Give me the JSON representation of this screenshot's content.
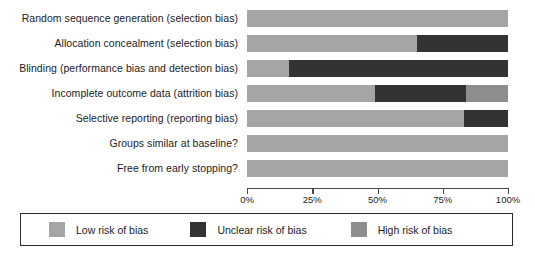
{
  "chart_data": {
    "type": "bar",
    "orientation": "horizontal",
    "stacked": true,
    "title": "",
    "xlabel": "",
    "ylabel": "",
    "xlim": [
      0,
      100
    ],
    "grid": false,
    "legend_position": "bottom",
    "categories": [
      "Random sequence generation (selection bias)",
      "Allocation concealment (selection bias)",
      "Blinding (performance bias and detection bias)",
      "Incomplete outcome data (attrition bias)",
      "Selective reporting (reporting bias)",
      "Groups similar at baseline?",
      "Free from early stopping?"
    ],
    "series": [
      {
        "name": "Low risk of bias",
        "color": "#a5a5a5",
        "values": [
          100,
          65,
          16,
          49,
          83,
          100,
          100
        ]
      },
      {
        "name": "Unclear risk of bias",
        "color": "#333333",
        "values": [
          0,
          35,
          84,
          35,
          17,
          0,
          0
        ]
      },
      {
        "name": "High risk of bias",
        "color": "#8e8e8e",
        "values": [
          0,
          0,
          0,
          16,
          0,
          0,
          0
        ]
      }
    ],
    "tick_values": [
      0,
      25,
      50,
      75,
      100
    ],
    "tick_labels": [
      "0%",
      "25%",
      "50%",
      "75%",
      "100%"
    ]
  },
  "axis": {
    "ticks": [
      {
        "label": "0%",
        "value": 0
      },
      {
        "label": "25%",
        "value": 25
      },
      {
        "label": "50%",
        "value": 50
      },
      {
        "label": "75%",
        "value": 75
      },
      {
        "label": "100%",
        "value": 100
      }
    ]
  },
  "legend": {
    "items": [
      {
        "label": "Low risk of bias",
        "color": "#a5a5a5"
      },
      {
        "label": "Unclear risk of bias",
        "color": "#333333"
      },
      {
        "label": "High risk of bias",
        "color": "#8e8e8e"
      }
    ]
  }
}
